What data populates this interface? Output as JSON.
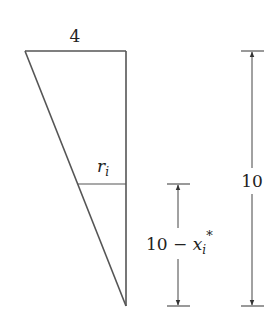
{
  "diagram": {
    "type": "cone-cross-section",
    "colors": {
      "stroke": "#555555",
      "text": "#222222",
      "background": "#ffffff"
    },
    "triangle": {
      "top_left": [
        25,
        51
      ],
      "top_right": [
        126,
        51
      ],
      "bottom": [
        126,
        306
      ],
      "top_width_label": "4"
    },
    "slice": {
      "y": 184,
      "radius_label_var": "r",
      "radius_label_sub": "i"
    },
    "dimensions": {
      "total_height": {
        "label": "10",
        "x": 252,
        "y_top": 51,
        "y_bottom": 306
      },
      "partial_height": {
        "label_prefix": "10 − ",
        "label_var": "x",
        "label_sub": "i",
        "label_sup": "*",
        "x": 178,
        "y_top": 184,
        "y_bottom": 306
      }
    }
  }
}
